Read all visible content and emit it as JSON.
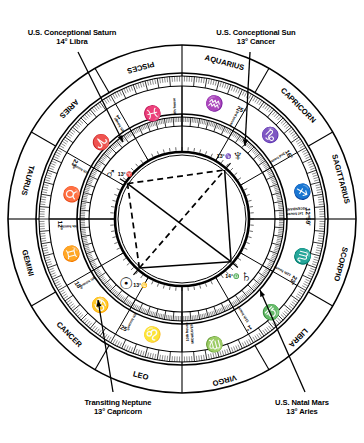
{
  "figure": {
    "type": "astrological-natal-chart",
    "background": "#ffffff",
    "ink": "#000000"
  },
  "annotations": [
    {
      "id": "saturn",
      "line1": "U.S. Conceptional Saturn",
      "line2": "14° Libra",
      "target_planet": "Saturn",
      "target_glyph": "♄"
    },
    {
      "id": "sun",
      "line1": "U.S. Conceptional Sun",
      "line2": "13° Cancer",
      "target_planet": "Sun",
      "target_glyph": "☉"
    },
    {
      "id": "neptune",
      "line1": "Transiting Neptune",
      "line2": "13° Capricorn",
      "target_planet": "Neptune",
      "target_glyph": "♆"
    },
    {
      "id": "mars",
      "line1": "U.S. Natal Mars",
      "line2": "13° Aries",
      "target_planet": "Mars",
      "target_glyph": "♂"
    }
  ],
  "signs": [
    {
      "name": "SAGITTARIUS",
      "glyph": "♐",
      "cusp_label": "12°59'",
      "mid_deg": 195
    },
    {
      "name": "CAPRICORN",
      "glyph": "♑",
      "cusp_label": "16°",
      "mid_deg": 225
    },
    {
      "name": "AQUARIUS",
      "glyph": "♒",
      "cusp_label": "25°",
      "mid_deg": 255
    },
    {
      "name": "PISCES",
      "glyph": "♓",
      "cusp_label": "",
      "mid_deg": 285
    },
    {
      "name": "ARIES",
      "glyph": "♈",
      "cusp_label": "1°",
      "mid_deg": 315
    },
    {
      "name": "TAURUS",
      "glyph": "♉",
      "cusp_label": "23°",
      "mid_deg": 345
    },
    {
      "name": "GEMINI",
      "glyph": "♊",
      "cusp_label": "12°",
      "mid_deg": 15
    },
    {
      "name": "CANCER",
      "glyph": "♋",
      "cusp_label": "18°",
      "mid_deg": 45
    },
    {
      "name": "LEO",
      "glyph": "♌",
      "cusp_label": "25°",
      "mid_deg": 75
    },
    {
      "name": "VIRGO",
      "glyph": "♍",
      "cusp_label": "",
      "mid_deg": 105
    },
    {
      "name": "LIBRA",
      "glyph": "♎",
      "cusp_label": "1°",
      "mid_deg": 135
    },
    {
      "name": "SCORPIO",
      "glyph": "♏",
      "cusp_label": "23°",
      "mid_deg": 165
    }
  ],
  "houses": [
    {
      "number": 1,
      "label": "1st house",
      "extra_label": "ASCENDANT",
      "cusp_deg": 180
    },
    {
      "number": 2,
      "label": "2nd house",
      "extra_label": "",
      "cusp_deg": 210
    },
    {
      "number": 3,
      "label": "3rd house",
      "extra_label": "",
      "cusp_deg": 240
    },
    {
      "number": 4,
      "label": "4th house",
      "extra_label": "",
      "cusp_deg": 270
    },
    {
      "number": 5,
      "label": "5th house",
      "extra_label": "",
      "cusp_deg": 300
    },
    {
      "number": 6,
      "label": "6th house",
      "extra_label": "",
      "cusp_deg": 330
    },
    {
      "number": 7,
      "label": "7th house",
      "extra_label": "",
      "cusp_deg": 0
    },
    {
      "number": 8,
      "label": "8th house",
      "extra_label": "",
      "cusp_deg": 30
    },
    {
      "number": 9,
      "label": "9th house",
      "extra_label": "",
      "cusp_deg": 60
    },
    {
      "number": 10,
      "label": "10th house",
      "extra_label": "MIDHEAVEN",
      "cusp_deg": 90
    },
    {
      "number": 11,
      "label": "11th house",
      "extra_label": "",
      "cusp_deg": 120
    },
    {
      "number": 12,
      "label": "12th house",
      "extra_label": "",
      "cusp_deg": 150
    }
  ],
  "planets": [
    {
      "name": "Saturn",
      "glyph": "♄",
      "degree_label": "14°♎",
      "wheel_deg": 139
    },
    {
      "name": "Sun",
      "glyph": "☉",
      "degree_label": "13°♋",
      "wheel_deg": 49
    },
    {
      "name": "Mars",
      "glyph": "♂",
      "degree_label": "13°♈",
      "wheel_deg": 327
    },
    {
      "name": "Neptune",
      "glyph": "♆",
      "degree_label": "13°♑",
      "wheel_deg": 229
    }
  ],
  "aspects": [
    {
      "from": "Saturn",
      "to": "Sun",
      "style": "solid",
      "kind": "square"
    },
    {
      "from": "Sun",
      "to": "Mars",
      "style": "dashed",
      "kind": "square"
    },
    {
      "from": "Mars",
      "to": "Neptune",
      "style": "dashed",
      "kind": "square"
    },
    {
      "from": "Neptune",
      "to": "Saturn",
      "style": "solid",
      "kind": "square"
    },
    {
      "from": "Saturn",
      "to": "Mars",
      "style": "solid",
      "kind": "opposition"
    },
    {
      "from": "Sun",
      "to": "Neptune",
      "style": "dashed",
      "kind": "opposition"
    }
  ]
}
